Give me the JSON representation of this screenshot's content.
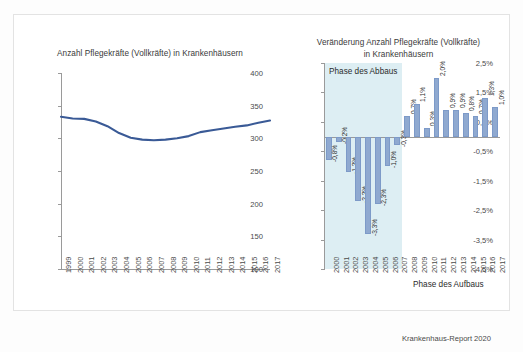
{
  "figure": {
    "source_note": "Krankenhaus-Report 2020",
    "accent_line_color": "#3a5a96",
    "bar_color": "#8fa9d0",
    "shade_color": "#ddeef3"
  },
  "left_panel": {
    "title": "Anzahl Pflegekräfte (Vollkräfte) in Krankenhäusern"
  },
  "right_panel": {
    "title_line1": "Veränderung Anzahl Pflegekräfte (Vollkräfte)",
    "title_line2": "in Krankenhäusern",
    "phase_abbau_label": "Phase des Abbaus",
    "phase_aufbau_label": "Phase des Aufbaus"
  },
  "chart_data": [
    {
      "type": "line",
      "title": "Anzahl Pflegekräfte (Vollkräfte) in Krankenhäusern",
      "xlabel": "",
      "ylabel": "",
      "ylim": [
        100,
        400
      ],
      "yticks": [
        100,
        150,
        200,
        250,
        300,
        350,
        400
      ],
      "ytick_labels": [
        "100",
        "150",
        "200",
        "250",
        "300",
        "350",
        "400"
      ],
      "grid": false,
      "legend": "none",
      "x": [
        1999,
        2000,
        2001,
        2002,
        2003,
        2004,
        2005,
        2006,
        2007,
        2008,
        2009,
        2010,
        2011,
        2012,
        2013,
        2014,
        2015,
        2016,
        2017
      ],
      "xtick_labels": [
        "1999",
        "2000",
        "2001",
        "2002",
        "2003",
        "2004",
        "2005",
        "2006",
        "2007",
        "2008",
        "2009",
        "2010",
        "2011",
        "2012",
        "2013",
        "2014",
        "2015",
        "2016",
        "2017"
      ],
      "values": [
        333.0,
        330.4,
        329.8,
        325.8,
        318.6,
        308.1,
        301.0,
        298.0,
        297.1,
        298.0,
        300.1,
        303.4,
        309.5,
        312.3,
        315.1,
        317.6,
        319.8,
        323.9,
        327.2
      ]
    },
    {
      "type": "bar",
      "title": "Veränderung Anzahl Pflegekräfte (Vollkräfte) in Krankenhäusern",
      "xlabel": "",
      "ylabel": "",
      "ylim": [
        -4.5,
        2.5
      ],
      "yticks": [
        -4.5,
        -3.5,
        -2.5,
        -1.5,
        -0.5,
        0.5,
        1.5,
        2.5
      ],
      "ytick_labels": [
        "-4,5%",
        "-3,5%",
        "-2,5%",
        "-1,5%",
        "-0,5%",
        "0,5%",
        "1,5%",
        "2,5%"
      ],
      "grid": false,
      "legend": "none",
      "categories": [
        "2000",
        "2001",
        "2002",
        "2003",
        "2004",
        "2005",
        "2006",
        "2007",
        "2008",
        "2009",
        "2010",
        "2011",
        "2012",
        "2013",
        "2014",
        "2015",
        "2016",
        "2017"
      ],
      "values": [
        -0.8,
        -0.2,
        -1.2,
        -2.2,
        -3.3,
        -2.3,
        -1.0,
        -0.3,
        0.7,
        1.1,
        0.3,
        2.0,
        0.9,
        0.9,
        0.8,
        0.7,
        1.3,
        1.0
      ],
      "data_labels": [
        "-0,8%",
        "-0,2%",
        "-1,2%",
        "-2,2%",
        "-3,3%",
        "-2,3%",
        "-1,0%",
        "-0,3%",
        "0,7%",
        "1,1%",
        "0,3%",
        "2,0%",
        "0,9%",
        "0,9%",
        "0,8%",
        "0,7%",
        "1,3%",
        "1,0%"
      ],
      "annotations": [
        {
          "text": "Phase des Abbaus",
          "region": "2000-2007"
        },
        {
          "text": "Phase des Aufbaus",
          "region": "2008-2017"
        }
      ]
    }
  ]
}
